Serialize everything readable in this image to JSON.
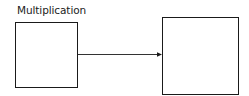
{
  "diagram": {
    "label": "Multiplication",
    "nodes": [
      {
        "id": "left-box",
        "label": ""
      },
      {
        "id": "right-box",
        "label": ""
      }
    ],
    "edges": [
      {
        "from": "left-box",
        "to": "right-box",
        "type": "arrow"
      }
    ],
    "colors": {
      "stroke": "#1a1a1a",
      "text": "#222222",
      "background": "#ffffff"
    }
  }
}
